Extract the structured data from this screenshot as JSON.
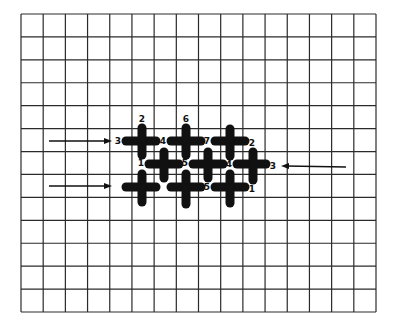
{
  "diagram": {
    "title": "",
    "type": "stitch-grid",
    "colors": {
      "background": "#ffffff",
      "grid": "#2a2a2a",
      "stitch": "#111111"
    },
    "grid": {
      "left": 21,
      "top": 14,
      "right": 376,
      "bottom": 312,
      "columns": 16,
      "rows": 13
    },
    "stitches": {
      "horizontal": [
        {
          "x1": 126,
          "x2": 156,
          "y": 141
        },
        {
          "x1": 171,
          "x2": 201,
          "y": 141
        },
        {
          "x1": 215,
          "x2": 245,
          "y": 141
        },
        {
          "x1": 149,
          "x2": 179,
          "y": 164
        },
        {
          "x1": 193,
          "x2": 223,
          "y": 164
        },
        {
          "x1": 237,
          "x2": 266,
          "y": 164
        },
        {
          "x1": 126,
          "x2": 156,
          "y": 187
        },
        {
          "x1": 171,
          "x2": 201,
          "y": 187
        },
        {
          "x1": 215,
          "x2": 245,
          "y": 187
        }
      ],
      "vertical": [
        {
          "x": 142,
          "y1": 128,
          "y2": 155
        },
        {
          "x": 186,
          "y1": 128,
          "y2": 155
        },
        {
          "x": 230,
          "y1": 129,
          "y2": 156
        },
        {
          "x": 164,
          "y1": 152,
          "y2": 178
        },
        {
          "x": 208,
          "y1": 152,
          "y2": 178
        },
        {
          "x": 253,
          "y1": 152,
          "y2": 180
        },
        {
          "x": 142,
          "y1": 174,
          "y2": 202
        },
        {
          "x": 186,
          "y1": 174,
          "y2": 204
        },
        {
          "x": 230,
          "y1": 174,
          "y2": 203
        }
      ]
    },
    "labels": [
      {
        "text": "2",
        "x": 142,
        "y": 119
      },
      {
        "text": "6",
        "x": 186,
        "y": 119
      },
      {
        "text": "3",
        "x": 118,
        "y": 141
      },
      {
        "text": "4",
        "x": 163,
        "y": 141
      },
      {
        "text": "7",
        "x": 207,
        "y": 141
      },
      {
        "text": "2",
        "x": 252,
        "y": 143
      },
      {
        "text": "1",
        "x": 141,
        "y": 163
      },
      {
        "text": "5",
        "x": 185,
        "y": 163
      },
      {
        "text": "4",
        "x": 229,
        "y": 164
      },
      {
        "text": "3",
        "x": 273,
        "y": 166
      },
      {
        "text": "5",
        "x": 207,
        "y": 187
      },
      {
        "text": "1",
        "x": 252,
        "y": 189
      }
    ],
    "arrows": [
      {
        "name": "arrow-row1-right",
        "x1": 49,
        "y1": 141,
        "x2": 112,
        "y2": 141
      },
      {
        "name": "arrow-row3-right",
        "x1": 49,
        "y1": 186,
        "x2": 112,
        "y2": 186
      },
      {
        "name": "arrow-row2-left",
        "x1": 346,
        "y1": 167,
        "x2": 281,
        "y2": 166
      }
    ]
  }
}
